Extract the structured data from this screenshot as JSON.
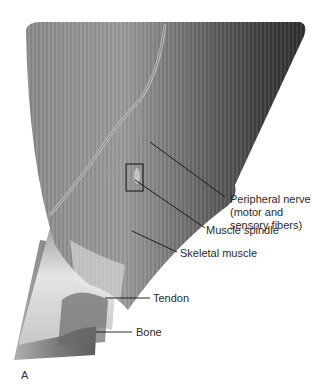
{
  "figure": {
    "panel_letter": "A",
    "colors": {
      "muscle_dark": "#3a3a3a",
      "muscle_mid": "#6e6e6e",
      "muscle_light": "#a8a8a8",
      "tendon": "#d8d8d8",
      "bone": "#7a7a7a",
      "label_text": "#2a2a2a",
      "leader_line": "#111111"
    },
    "labels": {
      "nerve_line1": "Peripheral nerve",
      "nerve_line2": "(motor and",
      "nerve_line3": "sensory fibers)",
      "spindle": "Muscle spindle",
      "skeletal": "Skeletal muscle",
      "tendon": "Tendon",
      "bone": "Bone"
    }
  }
}
